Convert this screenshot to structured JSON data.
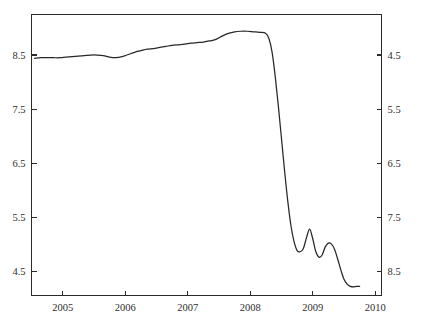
{
  "chart_data": {
    "type": "line",
    "title": "",
    "subtitle": "",
    "xlabel": "",
    "ylabel": "",
    "xlim": [
      2004.5,
      2010.1
    ],
    "ylim": [
      4.05,
      9.25
    ],
    "grid": false,
    "legend": null,
    "x_ticks": [
      2005,
      2006,
      2007,
      2008,
      2009,
      2010
    ],
    "x_tick_labels": [
      "2005",
      "2006",
      "2007",
      "2008",
      "2009",
      "2010"
    ],
    "y_ticks": [
      4.5,
      5.5,
      6.5,
      7.5,
      8.5
    ],
    "y_tick_labels": [
      "4.5",
      "5.5",
      "6.5",
      "7.5",
      "8.5"
    ],
    "y_axis_right_mirrored": true,
    "line_color": "#25272b",
    "series": [
      {
        "name": "series-1",
        "x": [
          2004.55,
          2004.65,
          2004.75,
          2004.85,
          2004.95,
          2005.05,
          2005.15,
          2005.25,
          2005.35,
          2005.45,
          2005.55,
          2005.65,
          2005.75,
          2005.85,
          2005.95,
          2006.05,
          2006.15,
          2006.25,
          2006.35,
          2006.45,
          2006.55,
          2006.65,
          2006.75,
          2006.85,
          2006.95,
          2007.05,
          2007.15,
          2007.25,
          2007.35,
          2007.45,
          2007.55,
          2007.65,
          2007.75,
          2007.85,
          2007.95,
          2008.05,
          2008.15,
          2008.25,
          2008.3,
          2008.35,
          2008.4,
          2008.45,
          2008.5,
          2008.55,
          2008.6,
          2008.65,
          2008.7,
          2008.75,
          2008.8,
          2008.85,
          2008.9,
          2008.95,
          2009.0,
          2009.05,
          2009.1,
          2009.15,
          2009.2,
          2009.25,
          2009.3,
          2009.35,
          2009.4,
          2009.45,
          2009.5,
          2009.55,
          2009.6,
          2009.65,
          2009.7,
          2009.75
        ],
        "y": [
          8.44,
          8.45,
          8.45,
          8.45,
          8.45,
          8.46,
          8.47,
          8.48,
          8.49,
          8.5,
          8.5,
          8.49,
          8.46,
          8.45,
          8.47,
          8.51,
          8.55,
          8.58,
          8.61,
          8.62,
          8.64,
          8.66,
          8.68,
          8.69,
          8.7,
          8.72,
          8.73,
          8.74,
          8.76,
          8.79,
          8.85,
          8.9,
          8.93,
          8.94,
          8.94,
          8.93,
          8.92,
          8.9,
          8.8,
          8.55,
          8.1,
          7.55,
          6.95,
          6.35,
          5.8,
          5.35,
          5.05,
          4.88,
          4.86,
          4.92,
          5.12,
          5.28,
          5.1,
          4.86,
          4.76,
          4.8,
          4.95,
          5.02,
          5.0,
          4.9,
          4.72,
          4.52,
          4.35,
          4.26,
          4.22,
          4.21,
          4.22,
          4.22
        ]
      }
    ]
  },
  "axes": {
    "left_labels": [
      "8.5",
      "7.5",
      "6.5",
      "5.5",
      "4.5"
    ],
    "right_labels": [
      "8.5",
      "7.5",
      "6.5",
      "5.5",
      "4.5"
    ],
    "bottom_labels": [
      "2005",
      "2006",
      "2007",
      "2008",
      "2009",
      "2010"
    ]
  }
}
